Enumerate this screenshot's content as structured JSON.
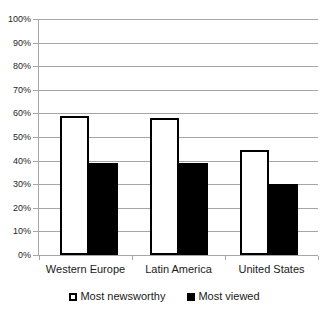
{
  "chart_data": {
    "type": "bar",
    "title": "",
    "subtitle": "",
    "xlabel": "",
    "ylabel": "",
    "categories": [
      "Western Europe",
      "Latin America",
      "United States"
    ],
    "series": [
      {
        "name": "Most newsworthy",
        "color": "#ffffff",
        "border": "#000000",
        "values": [
          59,
          58,
          44.5
        ]
      },
      {
        "name": "Most viewed",
        "color": "#000000",
        "border": "#000000",
        "values": [
          39,
          39,
          30
        ]
      }
    ],
    "ylim": [
      0,
      100
    ],
    "ytick_values": [
      0,
      10,
      20,
      30,
      40,
      50,
      60,
      70,
      80,
      90,
      100
    ],
    "ytick_labels": [
      "0%",
      "10%",
      "20%",
      "30%",
      "40%",
      "50%",
      "60%",
      "70%",
      "80%",
      "90%",
      "100%"
    ],
    "grid": true,
    "grid_axis": "y",
    "legend_position": "bottom",
    "legend_entries": [
      "Most newsworthy",
      "Most viewed"
    ],
    "value_format": "percent",
    "background_color": "#ffffff",
    "grid_color": "#a6a6a6",
    "text_color": "#1a1a1a"
  }
}
